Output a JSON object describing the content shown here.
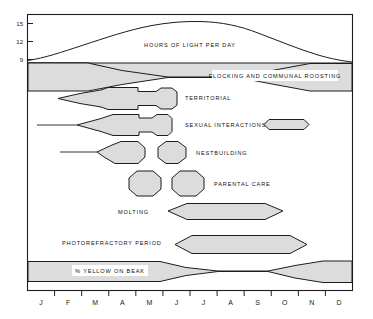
{
  "figure": {
    "name": "annual-cycle-diagram",
    "axis": {
      "y_ticks": [
        "15",
        "12",
        "9"
      ],
      "y_unit_caption": "HOURS OF LIGHT PER DAY",
      "months": [
        "J",
        "F",
        "M",
        "A",
        "M",
        "J",
        "J",
        "A",
        "S",
        "O",
        "N",
        "D"
      ]
    },
    "colors": {
      "ink": "#1d1d1d",
      "fill": "#dcdcdc",
      "background": "#ffffff"
    },
    "bands": [
      {
        "key": "photoperiod",
        "label": "HOURS OF LIGHT PER DAY"
      },
      {
        "key": "flocking",
        "label": "FLOCKING AND COMMUNAL ROOSTING"
      },
      {
        "key": "territorial",
        "label": "TERRITORIAL"
      },
      {
        "key": "sexual",
        "label": "SEXUAL INTERACTIONS"
      },
      {
        "key": "nestbuilding",
        "label": "NESTBUILDING"
      },
      {
        "key": "parental",
        "label": "PARENTAL CARE"
      },
      {
        "key": "molting",
        "label": "MOLTING"
      },
      {
        "key": "photorefract",
        "label": "PHOTOREFRACTORY PERIOD"
      },
      {
        "key": "yellowbeak",
        "label": "% YELLOW ON BEAK"
      }
    ]
  },
  "chart_data": {
    "type": "area",
    "xlabel": "",
    "ylabel": "Hours of light per day",
    "x": [
      "J",
      "F",
      "M",
      "A",
      "M",
      "J",
      "J",
      "A",
      "S",
      "O",
      "N",
      "D"
    ],
    "ylim": [
      8,
      16
    ],
    "yticks": [
      9,
      12,
      15
    ],
    "grid": false,
    "legend": "none",
    "series": [
      {
        "name": "HOURS OF LIGHT PER DAY",
        "type": "line",
        "units": "hours",
        "values": [
          9.3,
          10.4,
          11.8,
          13.3,
          14.7,
          15.4,
          15.5,
          14.8,
          13.4,
          11.8,
          10.3,
          9.4
        ]
      },
      {
        "name": "FLOCKING AND COMMUNAL ROOSTING",
        "type": "band",
        "units": "relative intensity 0-1",
        "values": [
          1.0,
          1.0,
          0.75,
          0.28,
          0.05,
          0.02,
          0.02,
          0.05,
          0.3,
          0.62,
          0.9,
          1.0
        ]
      },
      {
        "name": "TERRITORIAL",
        "type": "band",
        "units": "relative intensity 0-1",
        "values": [
          0.0,
          0.03,
          0.35,
          0.8,
          0.82,
          0.6,
          0.85,
          0.2,
          0.0,
          0.0,
          0.0,
          0.0
        ]
      },
      {
        "name": "SEXUAL INTERACTIONS",
        "type": "band",
        "units": "relative intensity 0-1",
        "values": [
          0.0,
          0.0,
          0.1,
          0.55,
          0.85,
          0.62,
          0.88,
          0.15,
          0.0,
          0.0,
          0.35,
          0.0
        ]
      },
      {
        "name": "NESTBUILDING",
        "type": "band",
        "units": "relative intensity 0-1",
        "values": [
          0.0,
          0.0,
          0.05,
          0.7,
          0.3,
          0.75,
          0.1,
          0.0,
          0.0,
          0.0,
          0.0,
          0.0
        ]
      },
      {
        "name": "PARENTAL CARE",
        "type": "band",
        "units": "relative intensity 0-1",
        "values": [
          0.0,
          0.0,
          0.0,
          0.15,
          0.8,
          0.25,
          0.8,
          0.15,
          0.0,
          0.0,
          0.0,
          0.0
        ]
      },
      {
        "name": "MOLTING",
        "type": "band",
        "units": "relative intensity 0-1",
        "values": [
          0.0,
          0.0,
          0.0,
          0.0,
          0.0,
          0.05,
          0.85,
          0.95,
          0.8,
          0.1,
          0.0,
          0.0
        ]
      },
      {
        "name": "PHOTOREFRACTORY PERIOD",
        "type": "band",
        "units": "relative intensity 0-1",
        "values": [
          0.0,
          0.0,
          0.0,
          0.0,
          0.05,
          0.85,
          0.95,
          0.95,
          0.9,
          0.5,
          0.0,
          0.0
        ]
      },
      {
        "name": "% YELLOW ON BEAK",
        "type": "band",
        "units": "percent (relative)",
        "values": [
          1.0,
          1.0,
          1.0,
          1.0,
          0.85,
          0.25,
          0.04,
          0.04,
          0.04,
          0.3,
          0.8,
          1.0
        ]
      }
    ]
  }
}
